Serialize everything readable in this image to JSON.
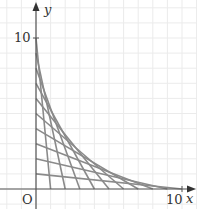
{
  "figure": {
    "type": "string-art envelope diagram",
    "axes": {
      "x_label": "x",
      "y_label": "y",
      "origin_label": "O",
      "x_tick_label": "10",
      "y_tick_label": "10",
      "x_range": [
        0,
        10
      ],
      "y_range": [
        0,
        10
      ]
    },
    "grid": {
      "on": true,
      "spacing_units": 1,
      "color": "#ebebeb"
    },
    "line_color": "#8a8a8a",
    "axis_color": "#555555",
    "segments": [
      {
        "y_intercept": 10,
        "x_intercept": 1
      },
      {
        "y_intercept": 9,
        "x_intercept": 2
      },
      {
        "y_intercept": 8,
        "x_intercept": 3
      },
      {
        "y_intercept": 7,
        "x_intercept": 4
      },
      {
        "y_intercept": 6,
        "x_intercept": 5
      },
      {
        "y_intercept": 5,
        "x_intercept": 6
      },
      {
        "y_intercept": 4,
        "x_intercept": 7
      },
      {
        "y_intercept": 3,
        "x_intercept": 8
      },
      {
        "y_intercept": 2,
        "x_intercept": 9
      },
      {
        "y_intercept": 1,
        "x_intercept": 10
      }
    ]
  }
}
